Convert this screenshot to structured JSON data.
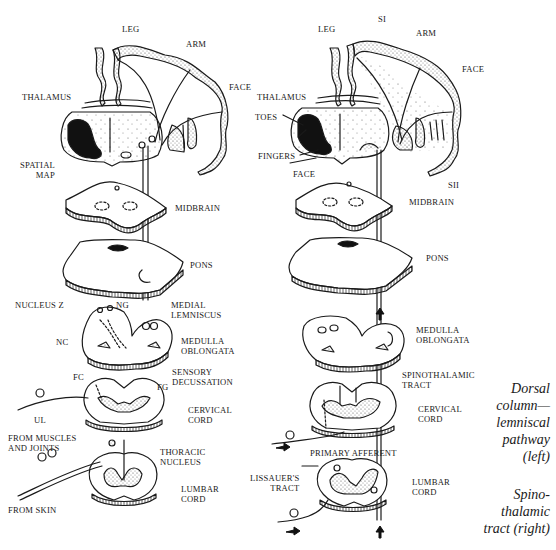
{
  "left_diagram": {
    "title": "Dorsal column-lemniscal pathway",
    "labels": {
      "leg": "LEG",
      "arm": "ARM",
      "face": "FACE",
      "thalamus": "THALAMUS",
      "spatial_map": "SPATIAL\nMAP",
      "midbrain": "MIDBRAIN",
      "pons": "PONS",
      "nucleus_z": "NUCLEUS Z",
      "ng": "NG",
      "medial_lemniscus": "MEDIAL\nLEMNISCUS",
      "nc": "NC",
      "medulla_oblongata": "MEDULLA\nOBLONGATA",
      "fc": "FC",
      "fg": "FG",
      "sensory_decussation": "SENSORY\nDECUSSATION",
      "ul": "UL",
      "cervical_cord": "CERVICAL\nCORD",
      "from_muscles_and_joints": "FROM MUSCLES\nAND JOINTS",
      "thoracic_nucleus": "THORACIC\nNUCLEUS",
      "lumbar_cord": "LUMBAR\nCORD",
      "from_skin": "FROM SKIN"
    }
  },
  "right_diagram": {
    "title": "Spinothalamic tract",
    "labels": {
      "si": "SI",
      "leg": "LEG",
      "arm": "ARM",
      "face_cortex": "FACE",
      "thalamus": "THALAMUS",
      "toes": "TOES",
      "fingers": "FINGERS",
      "face_thalamus": "FACE",
      "sii": "SII",
      "midbrain": "MIDBRAIN",
      "pons": "PONS",
      "medulla_oblongata": "MEDULLA\nOBLONGATA",
      "spinothalamic_tract": "SPINOTHALAMIC\nTRACT",
      "cervical_cord": "CERVICAL\nCORD",
      "primary_afferent": "PRIMARY AFFERENT",
      "lissauers_tract": "LISSAUER'S\nTRACT",
      "lumbar_cord": "LUMBAR\nCORD"
    }
  },
  "caption": {
    "line1": "Dorsal\ncolumn—\nlemniscal\npathway\n(left)",
    "line2": "Spino-\nthalamic\ntract (right)"
  },
  "colors": {
    "ink": "#1a1a1a",
    "background": "#ffffff",
    "stipple": "#9a9a9a"
  }
}
